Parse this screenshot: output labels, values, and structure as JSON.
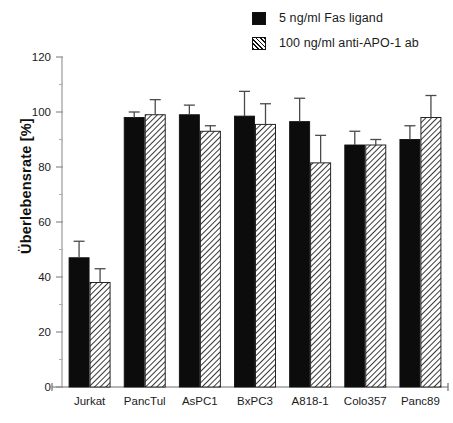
{
  "legend": {
    "position": "top-right",
    "entries": [
      {
        "swatch": "solid-black-square-icon",
        "label": "5 ng/ml Fas ligand",
        "fill": "solid"
      },
      {
        "swatch": "hatched-square-icon",
        "label": "100 ng/ml anti-APO-1 ab",
        "fill": "hatch"
      }
    ]
  },
  "axes": {
    "ylabel": "Überlebensrate [%]",
    "yticks": [
      "0",
      "20",
      "40",
      "60",
      "80",
      "100",
      "120"
    ],
    "xlabel": ""
  },
  "caption_partial": "",
  "chart_data": {
    "type": "bar",
    "title": "",
    "xlabel": "",
    "ylabel": "Überlebensrate [%]",
    "ylim": [
      0,
      120
    ],
    "yticks": [
      0,
      20,
      40,
      60,
      80,
      100,
      120
    ],
    "grid": false,
    "legend_position": "top-right",
    "categories": [
      "Jurkat",
      "PancTul",
      "AsPC1",
      "BxPC3",
      "A818-1",
      "Colo357",
      "Panc89"
    ],
    "series": [
      {
        "name": "5 ng/ml Fas ligand",
        "fill": "solid",
        "color": "#0c0c0c",
        "values": [
          47,
          98,
          99,
          98.5,
          96.5,
          88,
          90
        ],
        "errors": [
          6,
          2,
          3.5,
          9,
          8.5,
          5,
          5
        ]
      },
      {
        "name": "100 ng/ml anti-APO-1 ab",
        "fill": "hatch",
        "color": "#ffffff",
        "values": [
          38,
          99,
          93,
          95.5,
          81.5,
          88,
          98
        ],
        "errors": [
          5,
          5.5,
          2,
          7.5,
          10,
          2,
          8
        ]
      }
    ]
  }
}
